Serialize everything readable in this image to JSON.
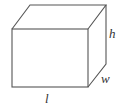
{
  "diagram": {
    "labels": {
      "length": "l",
      "width": "w",
      "height": "h"
    },
    "stroke_color": "#555555"
  }
}
